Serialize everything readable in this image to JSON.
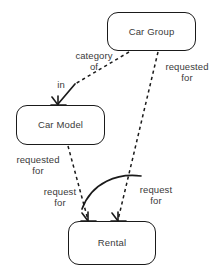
{
  "diagram": {
    "type": "entity-relationship-diagram",
    "background_color": "#ffffff",
    "line_color": "#1a1a1a",
    "text_color": "#3a3a3a",
    "entities": [
      {
        "id": "car-group",
        "label": "Car Group"
      },
      {
        "id": "car-model",
        "label": "Car Model"
      },
      {
        "id": "rental",
        "label": "Rental"
      }
    ],
    "relationships": [
      {
        "id": "category-of",
        "label": "category of",
        "label_line1": "category",
        "label_line2": "of",
        "from": "car-group",
        "to": "car-model",
        "style": "dashed"
      },
      {
        "id": "in",
        "label": "in",
        "from": "car-group",
        "to": "car-model",
        "style": "solid",
        "cardinality": "crows-foot"
      },
      {
        "id": "requested-for-car-group",
        "label": "requested for",
        "label_line1": "requested",
        "label_line2": "for",
        "from": "car-group",
        "to": "rental",
        "style": "dashed"
      },
      {
        "id": "requested-for-car-model",
        "label": "requested for",
        "label_line1": "requested",
        "label_line2": "for",
        "from": "car-model",
        "to": "rental",
        "style": "dashed"
      },
      {
        "id": "request-for-left",
        "label": "request for",
        "label_line1": "request",
        "label_line2": "for",
        "from": "car-model",
        "to": "rental",
        "style": "solid",
        "cardinality": "crows-foot"
      },
      {
        "id": "request-for-right",
        "label": "request for",
        "label_line1": "request",
        "label_line2": "for",
        "from": "car-group",
        "to": "rental",
        "style": "solid",
        "cardinality": "crows-foot"
      }
    ]
  }
}
